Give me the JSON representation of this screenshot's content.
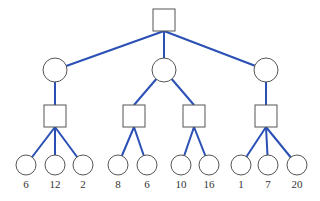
{
  "diagram": {
    "type": "game-tree",
    "colors": {
      "edge": "#2a4fb5",
      "node_stroke": "#555555",
      "label": "#333333"
    },
    "root": {
      "shape": "square",
      "x": 164,
      "y": 20
    },
    "level1": [
      {
        "shape": "circle",
        "x": 55,
        "y": 70
      },
      {
        "shape": "circle",
        "x": 164,
        "y": 70
      },
      {
        "shape": "circle",
        "x": 266,
        "y": 70
      }
    ],
    "level2": [
      {
        "shape": "square",
        "parent": 0,
        "x": 55,
        "y": 116
      },
      {
        "shape": "square",
        "parent": 1,
        "x": 134,
        "y": 116
      },
      {
        "shape": "square",
        "parent": 1,
        "x": 194,
        "y": 116
      },
      {
        "shape": "square",
        "parent": 2,
        "x": 266,
        "y": 116
      }
    ],
    "leaves": [
      {
        "parent": 0,
        "x": 26,
        "y": 165,
        "value": "6"
      },
      {
        "parent": 0,
        "x": 55,
        "y": 165,
        "value": "12"
      },
      {
        "parent": 0,
        "x": 83,
        "y": 165,
        "value": "2"
      },
      {
        "parent": 1,
        "x": 118,
        "y": 165,
        "value": "8"
      },
      {
        "parent": 1,
        "x": 147,
        "y": 165,
        "value": "6"
      },
      {
        "parent": 2,
        "x": 181,
        "y": 165,
        "value": "10"
      },
      {
        "parent": 2,
        "x": 209,
        "y": 165,
        "value": "16"
      },
      {
        "parent": 3,
        "x": 241,
        "y": 165,
        "value": "1"
      },
      {
        "parent": 3,
        "x": 268,
        "y": 165,
        "value": "7"
      },
      {
        "parent": 3,
        "x": 297,
        "y": 165,
        "value": "20"
      }
    ]
  }
}
